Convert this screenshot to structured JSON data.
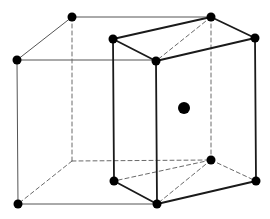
{
  "diagram": {
    "colors": {
      "background": "#ffffff",
      "thin_line": "#555555",
      "bold_line": "#1a1a1a",
      "dashed_line": "#6a6a6a",
      "atom": "#000000"
    },
    "cube": {
      "solid_edges": [
        [
          17,
          60,
          72,
          17
        ],
        [
          72,
          17,
          211,
          17
        ],
        [
          17,
          60,
          157,
          60
        ],
        [
          17,
          60,
          18,
          204
        ],
        [
          18,
          204,
          157,
          204
        ]
      ],
      "dashed_edges": [
        [
          72,
          17,
          72,
          161
        ],
        [
          72,
          161,
          211,
          160
        ],
        [
          72,
          161,
          18,
          204
        ]
      ]
    },
    "prism": {
      "bold_edges": [
        [
          113,
          39,
          211,
          17
        ],
        [
          211,
          17,
          255,
          38
        ],
        [
          255,
          38,
          156,
          61
        ],
        [
          156,
          61,
          113,
          39
        ],
        [
          113,
          39,
          114,
          181
        ],
        [
          156,
          61,
          157,
          204
        ],
        [
          255,
          38,
          256,
          181
        ],
        [
          114,
          181,
          157,
          204
        ],
        [
          157,
          204,
          256,
          181
        ]
      ],
      "dashed_edges": [
        [
          211,
          17,
          156,
          61
        ],
        [
          211,
          17,
          211,
          160
        ],
        [
          211,
          160,
          114,
          181
        ],
        [
          211,
          160,
          256,
          181
        ],
        [
          211,
          160,
          157,
          204
        ]
      ]
    },
    "atoms": [
      {
        "name": "cube-top-front-left",
        "x": 17,
        "y": 60,
        "r": 4.5
      },
      {
        "name": "cube-top-back-left",
        "x": 72,
        "y": 17,
        "r": 4.5
      },
      {
        "name": "cube-top-back-right",
        "x": 211,
        "y": 17,
        "r": 4.5
      },
      {
        "name": "prism-top-left",
        "x": 113,
        "y": 39,
        "r": 4.5
      },
      {
        "name": "prism-top-right",
        "x": 255,
        "y": 38,
        "r": 4.5
      },
      {
        "name": "prism-top-front",
        "x": 156,
        "y": 61,
        "r": 4.5
      },
      {
        "name": "body-center",
        "x": 184,
        "y": 108,
        "r": 6
      },
      {
        "name": "prism-bottom-back",
        "x": 211,
        "y": 160,
        "r": 4.5
      },
      {
        "name": "prism-bottom-left",
        "x": 114,
        "y": 181,
        "r": 4.5
      },
      {
        "name": "prism-bottom-right",
        "x": 256,
        "y": 181,
        "r": 4.5
      },
      {
        "name": "prism-bottom-front",
        "x": 157,
        "y": 204,
        "r": 4.5
      },
      {
        "name": "cube-bottom-front-left",
        "x": 18,
        "y": 204,
        "r": 4.5
      }
    ]
  }
}
